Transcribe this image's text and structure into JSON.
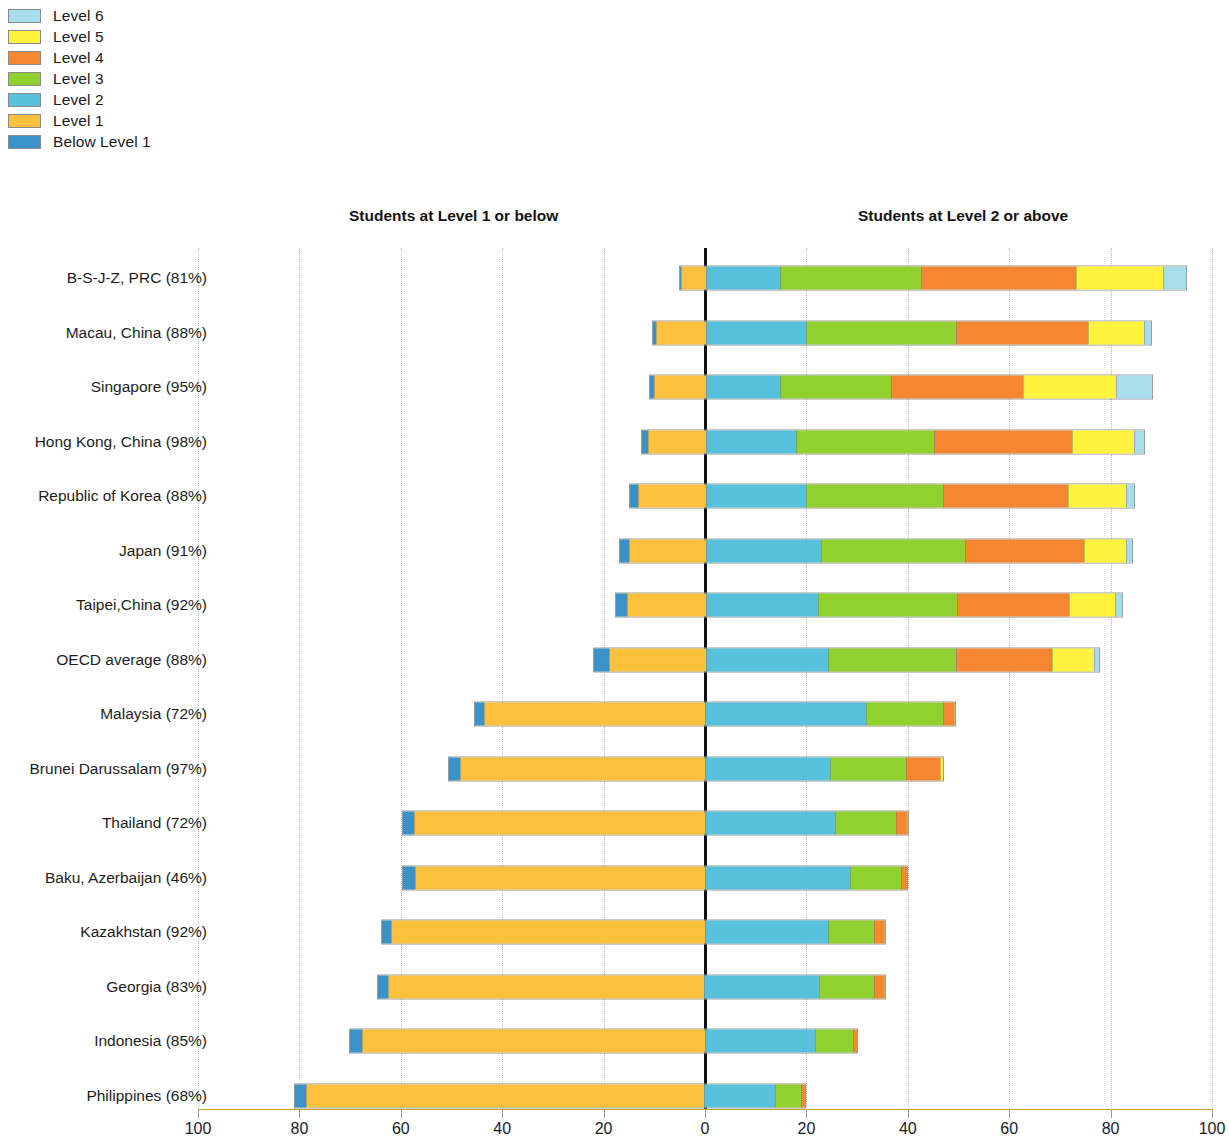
{
  "legend": {
    "items": [
      {
        "label": "Level 6",
        "color": "#A8DDEE"
      },
      {
        "label": "Level 5",
        "color": "#FFF33F"
      },
      {
        "label": "Level 4",
        "color": "#F58733"
      },
      {
        "label": "Level 3",
        "color": "#90D02F"
      },
      {
        "label": "Level 2",
        "color": "#57C1DB"
      },
      {
        "label": "Level 1",
        "color": "#FBC03C"
      },
      {
        "label": "Below Level 1",
        "color": "#3A92C8"
      }
    ]
  },
  "headers": {
    "left": "Students at Level 1 or below",
    "right": "Students at Level 2 or above"
  },
  "chart_data": {
    "type": "bar",
    "subtype": "diverging-stacked-bar",
    "title": "",
    "xlabel": "",
    "ylabel": "",
    "xlim": [
      -100,
      100
    ],
    "x_ticks": [
      {
        "value": -100,
        "label": "100"
      },
      {
        "value": -80,
        "label": "80"
      },
      {
        "value": -60,
        "label": "60"
      },
      {
        "value": -40,
        "label": "40"
      },
      {
        "value": -20,
        "label": "20"
      },
      {
        "value": 0,
        "label": "0"
      },
      {
        "value": 20,
        "label": "20"
      },
      {
        "value": 40,
        "label": "40"
      },
      {
        "value": 60,
        "label": "60"
      },
      {
        "value": 80,
        "label": "80"
      },
      {
        "value": 100,
        "label": "100"
      }
    ],
    "grid": true,
    "legend_position": "top-left",
    "zero_line": true,
    "series": [
      {
        "name": "Below Level 1",
        "color": "#3A92C8",
        "side": "left"
      },
      {
        "name": "Level 1",
        "color": "#FBC03C",
        "side": "left"
      },
      {
        "name": "Level 2",
        "color": "#57C1DB",
        "side": "right"
      },
      {
        "name": "Level 3",
        "color": "#90D02F",
        "side": "right"
      },
      {
        "name": "Level 4",
        "color": "#F58733",
        "side": "right"
      },
      {
        "name": "Level 5",
        "color": "#FFF33F",
        "side": "right"
      },
      {
        "name": "Level 6",
        "color": "#A8DDEE",
        "side": "right"
      }
    ],
    "categories": [
      "B-S-J-Z, PRC (81%)",
      "Macau, China (88%)",
      "Singapore (95%)",
      "Hong Kong, China (98%)",
      "Republic of Korea (88%)",
      "Japan (91%)",
      "Taipei,China (92%)",
      "OECD average (88%)",
      "Malaysia (72%)",
      "Brunei Darussalam (97%)",
      "Thailand (72%)",
      "Baku, Azerbaijan (46%)",
      "Kazakhstan (92%)",
      "Georgia (83%)",
      "Indonesia (85%)",
      "Philippines (68%)"
    ],
    "rows": [
      {
        "category": "B-S-J-Z, PRC (81%)",
        "below1": 0.3,
        "l1": 4.9,
        "l2": 14.7,
        "l3": 27.9,
        "l4": 30.6,
        "l5": 17.3,
        "l6": 4.5
      },
      {
        "category": "Macau, China (88%)",
        "below1": 0.6,
        "l1": 9.9,
        "l2": 19.8,
        "l3": 29.7,
        "l4": 26.1,
        "l5": 11.1,
        "l6": 1.4
      },
      {
        "category": "Singapore (95%)",
        "below1": 0.7,
        "l1": 10.3,
        "l2": 14.6,
        "l3": 22.1,
        "l4": 26.2,
        "l5": 18.3,
        "l6": 7.1
      },
      {
        "category": "Hong Kong, China (98%)",
        "below1": 1.2,
        "l1": 11.4,
        "l2": 17.8,
        "l3": 27.4,
        "l4": 27.3,
        "l5": 12.3,
        "l6": 2.0
      },
      {
        "category": "Republic of Korea (88%)",
        "below1": 1.6,
        "l1": 13.4,
        "l2": 19.9,
        "l3": 27.1,
        "l4": 24.8,
        "l5": 11.4,
        "l6": 1.6
      },
      {
        "category": "Japan (91%)",
        "below1": 1.9,
        "l1": 15.1,
        "l2": 22.9,
        "l3": 28.4,
        "l4": 23.6,
        "l5": 8.3,
        "l6": 1.2
      },
      {
        "category": "Taipei,China (92%)",
        "below1": 2.2,
        "l1": 15.6,
        "l2": 22.3,
        "l3": 27.5,
        "l4": 22.1,
        "l5": 9.2,
        "l6": 1.3
      },
      {
        "category": "OECD average (88%)",
        "below1": 2.9,
        "l1": 19.1,
        "l2": 24.2,
        "l3": 25.3,
        "l4": 19.2,
        "l5": 8.2,
        "l6": 1.1
      },
      {
        "category": "Malaysia (72%)",
        "below1": 1.7,
        "l1": 43.8,
        "l2": 31.9,
        "l3": 15.4,
        "l4": 2.2,
        "l5": 0.1,
        "l6": 0.0
      },
      {
        "category": "Brunei Darussalam (97%)",
        "below1": 2.1,
        "l1": 48.5,
        "l2": 24.8,
        "l3": 15.1,
        "l4": 6.6,
        "l5": 0.7,
        "l6": 0.0
      },
      {
        "category": "Thailand (72%)",
        "below1": 2.3,
        "l1": 57.5,
        "l2": 25.8,
        "l3": 12.2,
        "l4": 2.1,
        "l5": 0.1,
        "l6": 0.0
      },
      {
        "category": "Baku, Azerbaijan (46%)",
        "below1": 2.4,
        "l1": 57.3,
        "l2": 28.7,
        "l3": 10.1,
        "l4": 1.3,
        "l5": 0.0,
        "l6": 0.0
      },
      {
        "category": "Kazakhstan (92%)",
        "below1": 1.8,
        "l1": 62.1,
        "l2": 24.5,
        "l3": 9.1,
        "l4": 1.9,
        "l5": 0.2,
        "l6": 0.0
      },
      {
        "category": "Georgia (83%)",
        "below1": 2.0,
        "l1": 62.7,
        "l2": 22.8,
        "l3": 10.9,
        "l4": 1.9,
        "l5": 0.1,
        "l6": 0.0
      },
      {
        "category": "Indonesia (85%)",
        "below1": 2.4,
        "l1": 67.9,
        "l2": 21.8,
        "l3": 7.5,
        "l4": 0.9,
        "l5": 0.0,
        "l6": 0.0
      },
      {
        "category": "Philippines (68%)",
        "below1": 2.2,
        "l1": 78.8,
        "l2": 13.9,
        "l3": 5.3,
        "l4": 0.8,
        "l5": 0.0,
        "l6": 0.0
      }
    ]
  },
  "geometry": {
    "zero_x": 705,
    "px_per_unit": 5.07,
    "first_row_y": 278,
    "row_step": 54.5
  }
}
